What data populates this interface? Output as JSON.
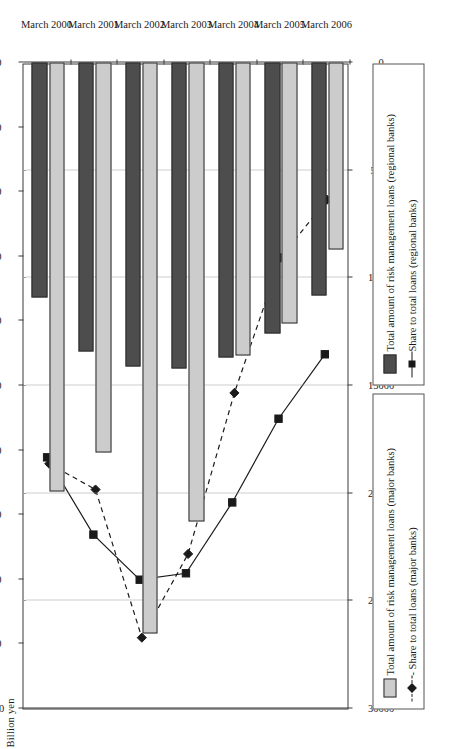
{
  "chart_data": {
    "type": "bar",
    "title": "",
    "categories": [
      "March 2000",
      "March 2001",
      "March 2002",
      "March 2003",
      "March 2004",
      "March 2005",
      "March 2006"
    ],
    "xlabel": "Billion yen",
    "secondary_axis_label": "%",
    "ylim": [
      0,
      30000
    ],
    "secondary_ylim": [
      0,
      10.0
    ],
    "grid": true,
    "legend_position": "bottom",
    "yen_ticks": [
      "30000",
      "25000",
      "20000",
      "15000",
      "10000",
      "5000",
      "0"
    ],
    "yen_tick_values": [
      30000,
      25000,
      20000,
      15000,
      10000,
      5000,
      0
    ],
    "pct_ticks": [
      "10.0",
      "9.0",
      "8.0",
      "7.0",
      "6.0",
      "5.0",
      "4.0",
      "3.0",
      "2.0",
      "1.0",
      "0.0"
    ],
    "pct_tick_values": [
      10.0,
      9.0,
      8.0,
      7.0,
      6.0,
      5.0,
      4.0,
      3.0,
      2.0,
      1.0,
      0.0
    ],
    "series": [
      {
        "name": "Total amount of risk management loans (major banks)",
        "kind": "bar",
        "axis": "yen",
        "color": "#cccccc",
        "values": [
          19900,
          18100,
          26500,
          21300,
          13600,
          12100,
          8700
        ]
      },
      {
        "name": "Total amount of risk management loans (regional banks)",
        "kind": "bar",
        "axis": "yen",
        "color": "#4d4d4d",
        "values": [
          10900,
          13400,
          14100,
          14200,
          13700,
          12600,
          10800
        ]
      },
      {
        "name": "Share to total loans (major banks)",
        "kind": "line",
        "axis": "pct",
        "marker": "diamond",
        "dash": "dashed",
        "color": "#1a1a1a",
        "values": [
          6.2,
          6.6,
          8.9,
          7.6,
          5.1,
          3.0,
          2.1
        ]
      },
      {
        "name": "Share to total loans (regional banks)",
        "kind": "line",
        "axis": "pct",
        "marker": "square",
        "dash": "solid",
        "color": "#1a1a1a",
        "values": [
          6.1,
          7.3,
          8.0,
          7.9,
          6.8,
          5.5,
          4.5
        ]
      }
    ]
  },
  "legend": {
    "major_bar": "Total amount of risk management loans (major banks)",
    "major_line": "- Share to total loans (major banks)",
    "regional_bar": "Total amount of risk management loans (regional banks)",
    "regional_line": "Share to total loans (regional banks)"
  }
}
